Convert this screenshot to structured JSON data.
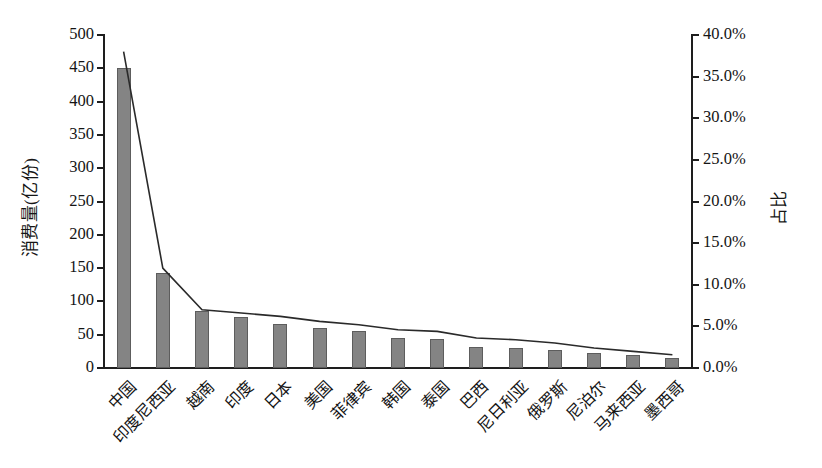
{
  "chart_data": {
    "type": "bar",
    "title": "",
    "subtitle": "",
    "xlabel": "",
    "ylabel": "消费量(亿份)",
    "y2label": "占比",
    "grid": false,
    "legend": "none",
    "categories": [
      "中国",
      "印度尼西亚",
      "越南",
      "印度",
      "日本",
      "美国",
      "菲律宾",
      "韩国",
      "泰国",
      "巴西",
      "尼日利亚",
      "俄罗斯",
      "尼泊尔",
      "马来西亚",
      "墨西哥"
    ],
    "series": [
      {
        "name": "消费量(亿份)",
        "type": "bar",
        "axis": "left",
        "values": [
          450,
          142,
          85,
          76,
          66,
          60,
          56,
          45,
          43,
          32,
          30,
          27,
          22,
          19,
          15
        ]
      },
      {
        "name": "占比",
        "type": "line",
        "axis": "right",
        "values": [
          38.0,
          12.0,
          7.0,
          6.6,
          6.2,
          5.6,
          5.2,
          4.6,
          4.4,
          3.6,
          3.4,
          3.0,
          2.4,
          2.0,
          1.6
        ]
      }
    ],
    "ylim": [
      0,
      500
    ],
    "yticks": [
      0,
      50,
      100,
      150,
      200,
      250,
      300,
      350,
      400,
      450,
      500
    ],
    "ytick_labels": [
      "0",
      "50",
      "100",
      "150",
      "200",
      "250",
      "300",
      "350",
      "400",
      "450",
      "500"
    ],
    "y2lim": [
      0,
      40
    ],
    "y2ticks": [
      0,
      5,
      10,
      15,
      20,
      25,
      30,
      35,
      40
    ],
    "y2tick_labels": [
      "0.0%",
      "5.0%",
      "10.0%",
      "15.0%",
      "20.0%",
      "25.0%",
      "30.0%",
      "35.0%",
      "40.0%"
    ],
    "colors": {
      "bar_fill": "#848484",
      "bar_edge": "#5d5d5d",
      "line": "#2a2a2a",
      "axis": "#1e1e1e",
      "text": "#141414",
      "background": "#ffffff"
    }
  }
}
